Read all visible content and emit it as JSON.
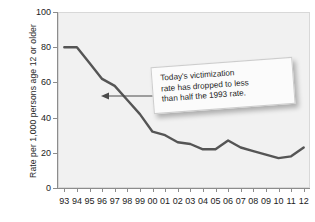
{
  "chart_data": {
    "type": "line",
    "title": "",
    "xlabel": "",
    "ylabel": "Rate per 1,000 persons age 12 or older",
    "ylim": [
      0,
      100
    ],
    "yticks": [
      0,
      20,
      40,
      60,
      80,
      100
    ],
    "grid": false,
    "legend": null,
    "categories": [
      "93",
      "94",
      "95",
      "96",
      "97",
      "98",
      "99",
      "00",
      "01",
      "02",
      "03",
      "04",
      "05",
      "06",
      "07",
      "08",
      "09",
      "10",
      "11",
      "12"
    ],
    "values": [
      80,
      80,
      71,
      62,
      58,
      50,
      42,
      32,
      30,
      26,
      25,
      22,
      22,
      27,
      23,
      21,
      19,
      17,
      18,
      23
    ],
    "series": [
      {
        "name": "Violent victimization rate",
        "values": [
          80,
          80,
          71,
          62,
          58,
          50,
          42,
          32,
          30,
          26,
          25,
          22,
          22,
          27,
          23,
          21,
          19,
          17,
          18,
          23
        ]
      }
    ],
    "annotations": [
      {
        "name": "callout",
        "text": "Today's victimization rate has dropped to less than half the 1993 rate.",
        "points_to_category": "99"
      }
    ]
  },
  "callout": {
    "line1": "Today's victimization",
    "line2": "rate has dropped to less",
    "line3": "than half the 1993 rate."
  },
  "colors": {
    "line": "#555555",
    "plot_background": "#f1f1f1",
    "axis": "#8c8c8c",
    "text": "#1c1c1c",
    "callout_background": "#fbfbfb"
  }
}
